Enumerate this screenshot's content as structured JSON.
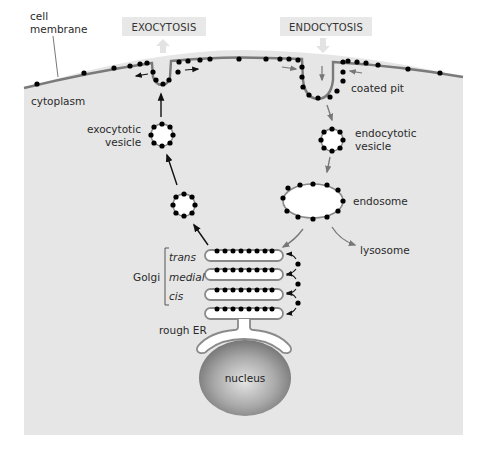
{
  "headers": {
    "exocytosis": "EXOCYTOSIS",
    "endocytosis": "ENDOCYTOSIS"
  },
  "labels": {
    "cell_membrane_line1": "cell",
    "cell_membrane_line2": "membrane",
    "cytoplasm": "cytoplasm",
    "exocytotic_vesicle_line1": "exocytotic",
    "exocytotic_vesicle_line2": "vesicle",
    "coated_pit": "coated pit",
    "endocytotic_vesicle_line1": "endocytotic",
    "endocytotic_vesicle_line2": "vesicle",
    "endosome": "endosome",
    "lysosome": "lysosome",
    "golgi": "Golgi",
    "golgi_trans": "trans",
    "golgi_medial": "medial",
    "golgi_cis": "cis",
    "rough_er": "rough ER",
    "nucleus": "nucleus"
  },
  "colors": {
    "background": "#ffffff",
    "cytoplasm": "#e6e6e6",
    "header_box": "#e8e8e8",
    "membrane": "#7a7a7a",
    "coat_dot": "#000000",
    "organelle_fill": "#ffffff",
    "organelle_outline": "#8a8a8a",
    "nucleus_dark": "#6e6e6e",
    "nucleus_light": "#d8d8d8",
    "arrow_black": "#111111",
    "arrow_gray": "#777777"
  }
}
